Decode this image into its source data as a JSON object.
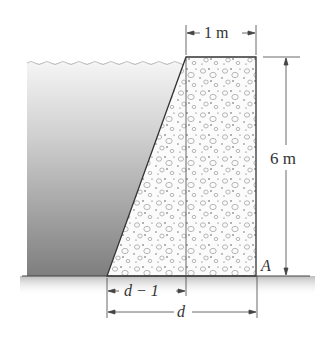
{
  "diagram": {
    "type": "dam-cross-section",
    "labels": {
      "top_width": "1 m",
      "height": "6 m",
      "point": "A",
      "base_sloped_part": "d − 1",
      "base_total": "d"
    },
    "colors": {
      "water_top": "#f2f2f2",
      "water_bottom": "#8a8a8a",
      "concrete_fill": "#fbfbfb",
      "aggregate": "#9a9a9a",
      "outline": "#333333",
      "ground_shadow": "#c8c8c8"
    }
  }
}
